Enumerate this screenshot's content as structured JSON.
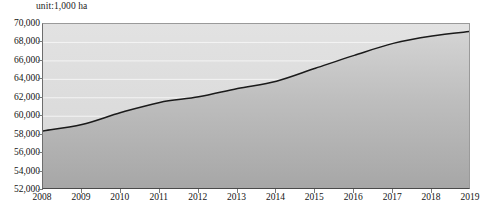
{
  "unit_label": "unit:1,000 ha",
  "axis": {
    "y_ticks": [
      "70,000",
      "68,000",
      "66,000",
      "64,000",
      "62,000",
      "60,000",
      "58,000",
      "56,000",
      "54,000",
      "52,000"
    ],
    "x_ticks": [
      "2008",
      "2009",
      "2010",
      "2011",
      "2012",
      "2013",
      "2014",
      "2015",
      "2016",
      "2017",
      "2018",
      "2019"
    ]
  },
  "colors": {
    "line": "#1a1a1a",
    "fill_top": "#d2d2d2",
    "fill_bottom": "#a9a9a9",
    "plot_background": "#dcdcdc",
    "gridline": "#f2f2f2",
    "axis": "#4a4a4a",
    "text": "#141414"
  },
  "chart_data": {
    "type": "area",
    "title": "",
    "subtitle": "",
    "xlabel": "",
    "ylabel": "unit:1,000 ha",
    "x": [
      2008,
      2009,
      2010,
      2011,
      2012,
      2013,
      2014,
      2015,
      2016,
      2017,
      2018,
      2019
    ],
    "categories": [
      "2008",
      "2009",
      "2010",
      "2011",
      "2012",
      "2013",
      "2014",
      "2015",
      "2016",
      "2017",
      "2018",
      "2019"
    ],
    "values": [
      58400,
      59100,
      60400,
      61500,
      62100,
      63000,
      63800,
      65200,
      66600,
      67900,
      68700,
      69200
    ],
    "series": [
      {
        "name": "area",
        "values": [
          58400,
          59100,
          60400,
          61500,
          62100,
          63000,
          63800,
          65200,
          66600,
          67900,
          68700,
          69200
        ]
      }
    ],
    "ylim": [
      52000,
      70000
    ],
    "xlim": [
      2008,
      2019
    ],
    "y_tick_step": 2000,
    "grid": true,
    "legend": "none"
  }
}
